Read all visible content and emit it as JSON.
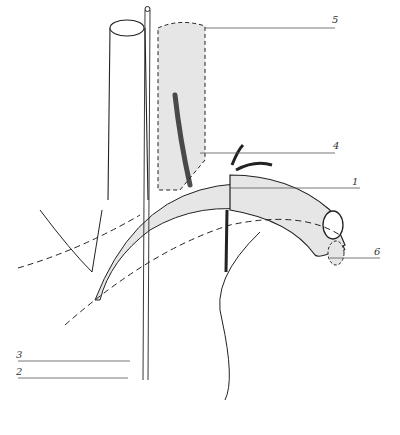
{
  "figure": {
    "type": "anatomical-line-drawing",
    "fill_color": "#e6e6e6",
    "line_color": "#222222",
    "labels": [
      {
        "id": "label-1",
        "text": "1",
        "x": 352,
        "y": 176
      },
      {
        "id": "label-2",
        "text": "2",
        "x": 16,
        "y": 368
      },
      {
        "id": "label-3",
        "text": "3",
        "x": 16,
        "y": 351
      },
      {
        "id": "label-4",
        "text": "4",
        "x": 333,
        "y": 140
      },
      {
        "id": "label-5",
        "text": "5",
        "x": 332,
        "y": 14
      },
      {
        "id": "label-6",
        "text": "6",
        "x": 374,
        "y": 247
      }
    ]
  }
}
